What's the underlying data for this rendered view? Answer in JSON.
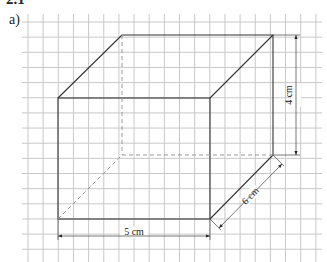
{
  "header": {
    "section": "2.1",
    "part_label": "a)"
  },
  "grid": {
    "x0": 22,
    "y0": 14,
    "x1": 322,
    "y1": 262,
    "spacing": 15.15,
    "first_vx": 28,
    "first_hy": 22,
    "color": "#c8c8c8"
  },
  "cube": {
    "front": {
      "x1": 58,
      "y1": 98,
      "x2": 210,
      "y2": 219
    },
    "back": {
      "x1": 122,
      "y1": 35,
      "x2": 273,
      "y2": 155
    },
    "edge_color": "#333333",
    "hidden_color": "#999999"
  },
  "dimensions": {
    "width": {
      "label": "5 cm"
    },
    "height": {
      "label": "4 cm"
    },
    "depth": {
      "label": "6 cm"
    }
  }
}
